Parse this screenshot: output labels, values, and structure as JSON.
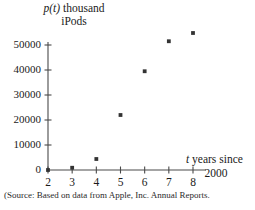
{
  "figure": {
    "source_note": "(Source: Based on data from Apple, Inc. Annual Reports.",
    "y_axis_label_line1_func": "p(t)",
    "y_axis_label_line1_rest": " thousand",
    "y_axis_label_line2": "iPods",
    "x_axis_label_var": "t",
    "x_axis_label_rest": " years since",
    "x_axis_label_line2": "2000"
  },
  "chart_data": {
    "type": "scatter",
    "title": "",
    "xlabel": "t years since 2000",
    "ylabel": "p(t) thousand iPods",
    "x": [
      2,
      3,
      4,
      5,
      6,
      7,
      8
    ],
    "values": [
      0,
      900,
      4400,
      22000,
      39500,
      51500,
      54800
    ],
    "xlim": [
      2,
      8
    ],
    "ylim": [
      0,
      58000
    ],
    "xticks": [
      2,
      3,
      4,
      5,
      6,
      7,
      8
    ],
    "xtick_labels": [
      "2",
      "3",
      "4",
      "5",
      "6",
      "7",
      "8"
    ],
    "yticks": [
      0,
      10000,
      20000,
      30000,
      40000,
      50000
    ],
    "ytick_labels": [
      "0",
      "10000",
      "20000",
      "30000",
      "40000",
      "50000"
    ],
    "grid": false,
    "legend": null,
    "marker_color": "#333333",
    "axis_color": "#4a4a4a"
  }
}
